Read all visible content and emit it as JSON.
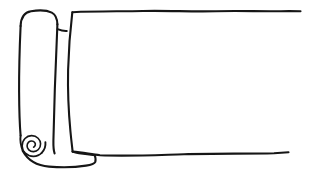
{
  "document": {
    "title": "Rolled Paper Scroll",
    "medium": "hand-drawn ink line art",
    "background_color": "#ffffff",
    "ink_color": "#161616",
    "canvas": {
      "width": 309,
      "height": 178
    }
  },
  "illustration": {
    "subject": "roll of paper partially unrolled",
    "description": "A cylindrical paper roll stands upright at the left with a spiral visible at its lower end, and a large blank sheet unrolls flat to the right edge.",
    "parts": [
      {
        "name": "paper-roll-cylinder",
        "label": "Rolled paper cylinder",
        "role": "The upright tube of coiled paper on the left side"
      },
      {
        "name": "roll-spiral",
        "label": "Coil spiral end",
        "role": "Spiral cross-section showing the coiled layers at the bottom of the roll",
        "turns": 3
      },
      {
        "name": "unrolled-sheet",
        "label": "Unrolled flat sheet",
        "role": "The large blank expanse of paper extending to the right"
      },
      {
        "name": "sheet-top-edge",
        "label": "Top edge of sheet"
      },
      {
        "name": "sheet-bottom-edge",
        "label": "Bottom edge of sheet"
      },
      {
        "name": "roll-flap-tick",
        "label": "Small fold tick",
        "role": "Short mark where the paper leaves the roll near the top"
      },
      {
        "name": "roll-bottom-lip",
        "label": "Bottom lip of roll",
        "role": "Lower curve of the roll meeting the flat sheet"
      }
    ],
    "colors": {
      "ink": "#161616",
      "paper": "#ffffff"
    },
    "text_content": []
  }
}
